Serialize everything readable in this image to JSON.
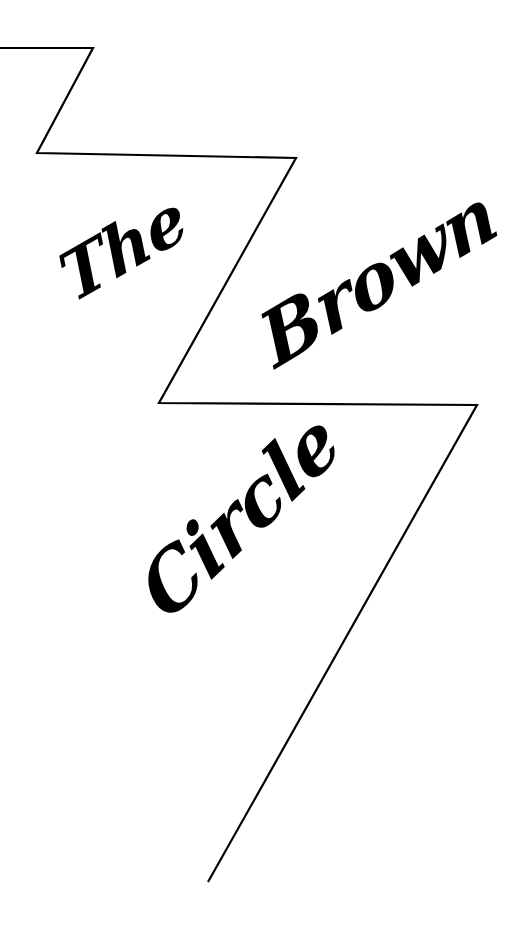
{
  "title": {
    "words": [
      "The",
      "Brown",
      "Circle"
    ]
  },
  "graphic": {
    "zigzag_points": "0,48 93,48 37,153 296,158 159,403 477,405 208,882",
    "stroke_color": "#000000",
    "background": "#ffffff"
  }
}
